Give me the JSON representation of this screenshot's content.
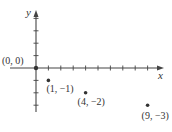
{
  "chart_data": {
    "type": "scatter",
    "title": "",
    "xlabel": "x",
    "ylabel": "y",
    "xlim": [
      -2,
      10
    ],
    "ylim": [
      -3.5,
      4.5
    ],
    "grid": false,
    "points": [
      {
        "x": 0,
        "y": 0,
        "label": "(0, 0)"
      },
      {
        "x": 1,
        "y": -1,
        "label": "(1, −1)"
      },
      {
        "x": 4,
        "y": -2,
        "label": "(4, −2)"
      },
      {
        "x": 9,
        "y": -3,
        "label": "(9, −3)"
      }
    ],
    "x_ticks": [
      1,
      2,
      3,
      4,
      5,
      6,
      7,
      8,
      9,
      10
    ],
    "y_ticks": [
      -3,
      -2,
      -1,
      1,
      2,
      3,
      4
    ]
  }
}
